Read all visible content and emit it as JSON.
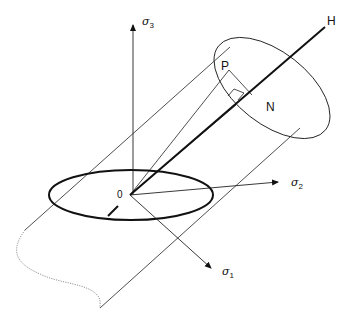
{
  "diagram": {
    "labels": {
      "sigma3": {
        "symbol": "σ",
        "subscript": "3"
      },
      "sigma2": {
        "symbol": "σ",
        "subscript": "2"
      },
      "sigma1": {
        "symbol": "σ",
        "subscript": "1"
      },
      "hydrostatic_axis": "H",
      "origin": "0",
      "point_p": "P",
      "point_n": "N"
    },
    "colors": {
      "line": "#111111",
      "dotted": "#777777",
      "background": "#ffffff"
    }
  }
}
